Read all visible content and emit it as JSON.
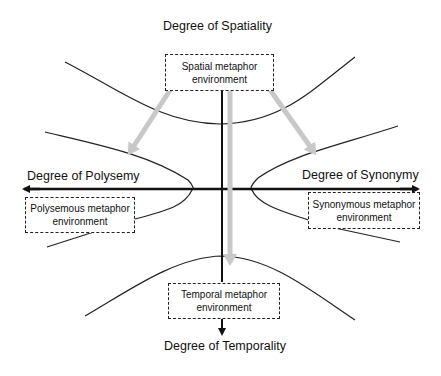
{
  "axes": {
    "top": "Degree of Spatiality",
    "bottom": "Degree of Temporality",
    "left": "Degree of Polysemy",
    "right": "Degree of Synonymy"
  },
  "environments": {
    "spatial": {
      "line1": "Spatial metaphor",
      "line2": "environment"
    },
    "temporal": {
      "line1": "Temporal metaphor",
      "line2": "environment"
    },
    "polysemous": {
      "line1": "Polysemous metaphor",
      "line2": "environment"
    },
    "synonymous": {
      "line1": "Synonymous metaphor",
      "line2": "environment"
    }
  },
  "colors": {
    "axis": "#111111",
    "curve": "#222222",
    "transition_arrow": "#c8c8c8",
    "box_border": "#222222"
  }
}
